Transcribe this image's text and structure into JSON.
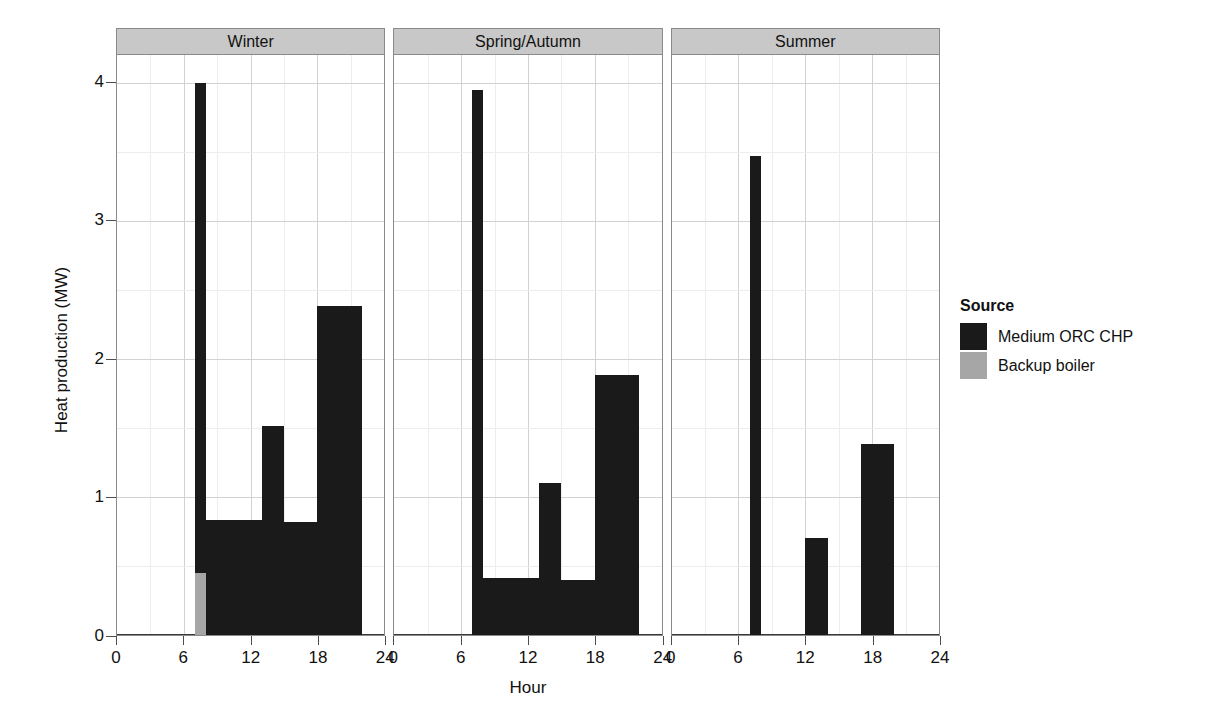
{
  "chart_data": {
    "type": "bar",
    "title": "",
    "subtitle": "",
    "xlabel": "Hour",
    "ylabel": "Heat production (MW)",
    "xlim": [
      0,
      24
    ],
    "ylim": [
      0,
      4.2
    ],
    "xticks": [
      0,
      6,
      12,
      18,
      24
    ],
    "yticks": [
      0,
      1,
      2,
      3,
      4
    ],
    "xtick_labels": [
      "0",
      "6",
      "12",
      "18",
      "24"
    ],
    "ytick_labels": [
      "0",
      "1",
      "2",
      "3",
      "4"
    ],
    "grid": "major-and-minor",
    "stacked": true,
    "legend": {
      "title": "Source",
      "position": "right",
      "entries": [
        {
          "name": "Medium ORC CHP",
          "color": "#1a1a1a"
        },
        {
          "name": "Backup boiler",
          "color": "#a6a6a6"
        }
      ]
    },
    "facets": [
      {
        "label": "Winter",
        "series": [
          {
            "name": "Medium ORC CHP",
            "color": "#1a1a1a",
            "bars": [
              {
                "x0": 7,
                "x1": 8,
                "value": 4.0
              },
              {
                "x0": 8,
                "x1": 9,
                "value": 0.83
              },
              {
                "x0": 9,
                "x1": 13,
                "value": 0.83
              },
              {
                "x0": 13,
                "x1": 15,
                "value": 1.51
              },
              {
                "x0": 15,
                "x1": 18,
                "value": 0.82
              },
              {
                "x0": 18,
                "x1": 22,
                "value": 2.38
              }
            ]
          },
          {
            "name": "Backup boiler",
            "color": "#a6a6a6",
            "bars": [
              {
                "x0": 7,
                "x1": 8,
                "value": 0.45
              }
            ]
          }
        ]
      },
      {
        "label": "Spring/Autumn",
        "series": [
          {
            "name": "Medium ORC CHP",
            "color": "#1a1a1a",
            "bars": [
              {
                "x0": 7,
                "x1": 8,
                "value": 3.95
              },
              {
                "x0": 8,
                "x1": 9,
                "value": 0.41
              },
              {
                "x0": 9,
                "x1": 13,
                "value": 0.41
              },
              {
                "x0": 13,
                "x1": 15,
                "value": 1.1
              },
              {
                "x0": 15,
                "x1": 18,
                "value": 0.4
              },
              {
                "x0": 18,
                "x1": 22,
                "value": 1.88
              }
            ]
          },
          {
            "name": "Backup boiler",
            "color": "#a6a6a6",
            "bars": []
          }
        ]
      },
      {
        "label": "Summer",
        "series": [
          {
            "name": "Medium ORC CHP",
            "color": "#1a1a1a",
            "bars": [
              {
                "x0": 7,
                "x1": 8,
                "value": 3.47
              },
              {
                "x0": 12,
                "x1": 14,
                "value": 0.7
              },
              {
                "x0": 17,
                "x1": 20,
                "value": 1.38
              }
            ]
          },
          {
            "name": "Backup boiler",
            "color": "#a6a6a6",
            "bars": []
          }
        ]
      }
    ]
  }
}
